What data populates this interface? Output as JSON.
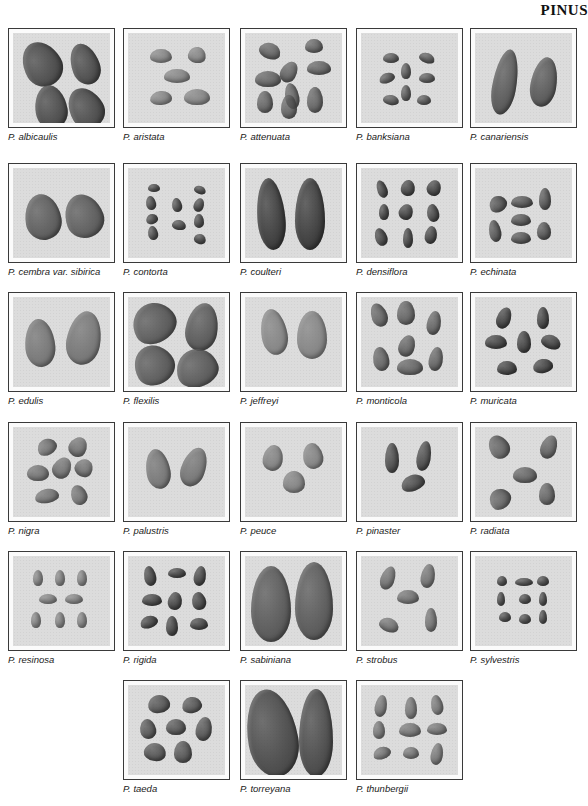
{
  "page": {
    "header": "PINUS"
  },
  "plates": [
    {
      "label": "P. albicaulis",
      "seed_color": "#3a3a3a",
      "seeds": [
        [
          10,
          8,
          38,
          46,
          -30
        ],
        [
          58,
          10,
          28,
          42,
          -20
        ],
        [
          22,
          52,
          32,
          44,
          -10
        ],
        [
          56,
          54,
          34,
          42,
          -30
        ]
      ]
    },
    {
      "label": "P. aristata",
      "seed_color": "#7a7a7a",
      "seeds": [
        [
          22,
          16,
          22,
          14,
          0
        ],
        [
          60,
          14,
          18,
          16,
          10
        ],
        [
          36,
          36,
          26,
          14,
          0
        ],
        [
          22,
          58,
          22,
          14,
          -5
        ],
        [
          56,
          56,
          26,
          16,
          0
        ]
      ]
    },
    {
      "label": "P. attenuata",
      "seed_color": "#555555",
      "seeds": [
        [
          14,
          10,
          22,
          16,
          20
        ],
        [
          60,
          6,
          18,
          14,
          0
        ],
        [
          36,
          28,
          16,
          22,
          30
        ],
        [
          62,
          28,
          24,
          14,
          0
        ],
        [
          10,
          38,
          26,
          16,
          0
        ],
        [
          40,
          50,
          14,
          26,
          -10
        ],
        [
          12,
          58,
          16,
          22,
          0
        ],
        [
          36,
          62,
          16,
          24,
          0
        ],
        [
          62,
          54,
          16,
          26,
          0
        ]
      ]
    },
    {
      "label": "P. banksiana",
      "seed_color": "#4a4a4a",
      "seeds": [
        [
          22,
          20,
          16,
          10,
          0
        ],
        [
          58,
          20,
          16,
          10,
          20
        ],
        [
          40,
          30,
          10,
          16,
          0
        ],
        [
          18,
          40,
          16,
          10,
          -20
        ],
        [
          58,
          40,
          16,
          10,
          0
        ],
        [
          40,
          52,
          10,
          16,
          0
        ],
        [
          22,
          62,
          16,
          10,
          10
        ],
        [
          56,
          62,
          14,
          10,
          0
        ]
      ]
    },
    {
      "label": "P. canariensis",
      "seed_color": "#4a4a4a",
      "seeds": [
        [
          18,
          16,
          24,
          66,
          10
        ],
        [
          56,
          24,
          26,
          50,
          10
        ]
      ]
    },
    {
      "label": "P. cembra var. sibirica",
      "seed_color": "#4d4d4d",
      "seeds": [
        [
          12,
          26,
          36,
          46,
          -10
        ],
        [
          52,
          26,
          38,
          44,
          -20
        ]
      ]
    },
    {
      "label": "P. contorta",
      "seed_color": "#3a3a3a",
      "seeds": [
        [
          20,
          16,
          12,
          8,
          0
        ],
        [
          66,
          18,
          12,
          8,
          20
        ],
        [
          18,
          28,
          10,
          14,
          -10
        ],
        [
          44,
          30,
          10,
          14,
          -10
        ],
        [
          66,
          30,
          10,
          14,
          20
        ],
        [
          18,
          46,
          12,
          10,
          -20
        ],
        [
          44,
          52,
          14,
          10,
          10
        ],
        [
          66,
          46,
          10,
          14,
          0
        ],
        [
          20,
          58,
          10,
          14,
          -10
        ],
        [
          66,
          66,
          12,
          10,
          20
        ]
      ]
    },
    {
      "label": "P. coulteri",
      "seed_color": "#2a2a2a",
      "seeds": [
        [
          12,
          10,
          28,
          72,
          -5
        ],
        [
          50,
          10,
          30,
          72,
          0
        ]
      ]
    },
    {
      "label": "P. densiflora",
      "seed_color": "#333333",
      "seeds": [
        [
          16,
          12,
          10,
          18,
          -20
        ],
        [
          40,
          12,
          14,
          16,
          10
        ],
        [
          66,
          12,
          14,
          16,
          20
        ],
        [
          18,
          36,
          10,
          16,
          0
        ],
        [
          38,
          36,
          14,
          16,
          20
        ],
        [
          66,
          36,
          12,
          18,
          -10
        ],
        [
          14,
          60,
          12,
          18,
          -20
        ],
        [
          42,
          60,
          10,
          20,
          0
        ],
        [
          64,
          58,
          12,
          18,
          10
        ]
      ]
    },
    {
      "label": "P. echinata",
      "seed_color": "#444444",
      "seeds": [
        [
          14,
          28,
          18,
          16,
          -30
        ],
        [
          36,
          28,
          22,
          12,
          0
        ],
        [
          64,
          20,
          12,
          22,
          0
        ],
        [
          36,
          46,
          20,
          12,
          0
        ],
        [
          14,
          52,
          12,
          22,
          -10
        ],
        [
          36,
          64,
          20,
          12,
          0
        ],
        [
          62,
          54,
          14,
          18,
          0
        ]
      ]
    },
    {
      "label": "P. edulis",
      "seed_color": "#6a6a6a",
      "seeds": [
        [
          12,
          22,
          30,
          48,
          -5
        ],
        [
          54,
          14,
          34,
          54,
          10
        ]
      ]
    },
    {
      "label": "P. flexilis",
      "seed_color": "#4a4a4a",
      "seeds": [
        [
          4,
          6,
          44,
          40,
          -30
        ],
        [
          58,
          6,
          32,
          48,
          10
        ],
        [
          6,
          48,
          40,
          40,
          -30
        ],
        [
          48,
          52,
          42,
          38,
          -20
        ]
      ]
    },
    {
      "label": "P. jeffreyi",
      "seed_color": "#7a7a7a",
      "seeds": [
        [
          16,
          12,
          26,
          46,
          -10
        ],
        [
          52,
          14,
          30,
          48,
          0
        ]
      ]
    },
    {
      "label": "P. monticola",
      "seed_color": "#555555",
      "seeds": [
        [
          10,
          6,
          16,
          24,
          -20
        ],
        [
          36,
          4,
          18,
          24,
          0
        ],
        [
          66,
          14,
          14,
          24,
          10
        ],
        [
          38,
          38,
          16,
          22,
          20
        ],
        [
          12,
          50,
          16,
          24,
          -10
        ],
        [
          36,
          62,
          26,
          16,
          0
        ],
        [
          68,
          50,
          14,
          24,
          10
        ]
      ]
    },
    {
      "label": "P. muricata",
      "seed_color": "#2f2f2f",
      "seeds": [
        [
          22,
          10,
          14,
          22,
          20
        ],
        [
          62,
          10,
          12,
          22,
          0
        ],
        [
          10,
          38,
          22,
          14,
          0
        ],
        [
          42,
          34,
          14,
          22,
          0
        ],
        [
          66,
          38,
          20,
          14,
          20
        ],
        [
          22,
          64,
          20,
          14,
          0
        ],
        [
          58,
          62,
          20,
          14,
          -10
        ]
      ]
    },
    {
      "label": "P. nigra",
      "seed_color": "#666666",
      "seeds": [
        [
          24,
          12,
          20,
          16,
          -30
        ],
        [
          56,
          10,
          18,
          20,
          30
        ],
        [
          14,
          38,
          22,
          16,
          0
        ],
        [
          40,
          30,
          18,
          22,
          30
        ],
        [
          62,
          32,
          18,
          18,
          30
        ],
        [
          22,
          62,
          24,
          14,
          -10
        ],
        [
          58,
          58,
          16,
          20,
          -20
        ]
      ]
    },
    {
      "label": "P. palustris",
      "seed_color": "#6a6a6a",
      "seeds": [
        [
          18,
          22,
          24,
          40,
          -10
        ],
        [
          54,
          20,
          24,
          40,
          20
        ]
      ]
    },
    {
      "label": "P. peuce",
      "seed_color": "#777777",
      "seeds": [
        [
          18,
          18,
          20,
          26,
          10
        ],
        [
          58,
          16,
          20,
          26,
          -10
        ],
        [
          38,
          44,
          22,
          22,
          0
        ]
      ]
    },
    {
      "label": "P. pinaster",
      "seed_color": "#3a3a3a",
      "seeds": [
        [
          24,
          16,
          14,
          30,
          0
        ],
        [
          56,
          14,
          14,
          30,
          10
        ],
        [
          40,
          48,
          24,
          16,
          -20
        ]
      ]
    },
    {
      "label": "P. radiata",
      "seed_color": "#555555",
      "seeds": [
        [
          14,
          8,
          20,
          24,
          -30
        ],
        [
          66,
          8,
          16,
          24,
          20
        ],
        [
          38,
          40,
          24,
          16,
          0
        ],
        [
          14,
          62,
          22,
          20,
          -40
        ],
        [
          64,
          56,
          16,
          22,
          0
        ]
      ]
    },
    {
      "label": "P. resinosa",
      "seed_color": "#7a7a7a",
      "seeds": [
        [
          20,
          14,
          10,
          16,
          0
        ],
        [
          42,
          14,
          10,
          16,
          0
        ],
        [
          64,
          14,
          10,
          16,
          0
        ],
        [
          26,
          38,
          18,
          10,
          0
        ],
        [
          52,
          38,
          18,
          10,
          0
        ],
        [
          18,
          56,
          10,
          16,
          0
        ],
        [
          42,
          56,
          10,
          16,
          0
        ],
        [
          64,
          56,
          10,
          16,
          0
        ]
      ]
    },
    {
      "label": "P. rigida",
      "seed_color": "#333333",
      "seeds": [
        [
          16,
          10,
          12,
          20,
          -10
        ],
        [
          40,
          12,
          18,
          10,
          0
        ],
        [
          66,
          10,
          12,
          20,
          10
        ],
        [
          14,
          38,
          20,
          12,
          0
        ],
        [
          40,
          36,
          14,
          18,
          10
        ],
        [
          64,
          36,
          14,
          18,
          -10
        ],
        [
          12,
          60,
          18,
          12,
          -20
        ],
        [
          38,
          60,
          12,
          20,
          0
        ],
        [
          62,
          62,
          18,
          12,
          0
        ]
      ]
    },
    {
      "label": "P. sabiniana",
      "seed_color": "#4a4a4a",
      "seeds": [
        [
          6,
          10,
          40,
          76,
          0
        ],
        [
          50,
          6,
          38,
          78,
          0
        ]
      ]
    },
    {
      "label": "P. strobus",
      "seed_color": "#666666",
      "seeds": [
        [
          20,
          10,
          14,
          24,
          20
        ],
        [
          60,
          8,
          14,
          24,
          10
        ],
        [
          36,
          34,
          22,
          14,
          0
        ],
        [
          18,
          62,
          20,
          14,
          20
        ],
        [
          64,
          52,
          12,
          24,
          0
        ]
      ]
    },
    {
      "label": "P. sylvestris",
      "seed_color": "#3a3a3a",
      "seeds": [
        [
          22,
          20,
          10,
          10,
          0
        ],
        [
          40,
          22,
          18,
          8,
          0
        ],
        [
          62,
          20,
          12,
          10,
          0
        ],
        [
          22,
          36,
          8,
          14,
          0
        ],
        [
          44,
          38,
          12,
          10,
          0
        ],
        [
          64,
          36,
          8,
          14,
          0
        ],
        [
          24,
          56,
          12,
          10,
          0
        ],
        [
          44,
          58,
          12,
          10,
          0
        ],
        [
          64,
          54,
          8,
          14,
          0
        ]
      ]
    },
    {
      "label": "P. taeda",
      "seed_color": "#444444",
      "seeds": [
        [
          20,
          10,
          22,
          18,
          -10
        ],
        [
          54,
          12,
          20,
          16,
          -10
        ],
        [
          12,
          34,
          16,
          20,
          -10
        ],
        [
          38,
          34,
          20,
          16,
          0
        ],
        [
          68,
          32,
          16,
          24,
          10
        ],
        [
          16,
          58,
          22,
          18,
          10
        ],
        [
          46,
          56,
          18,
          22,
          0
        ]
      ]
    },
    {
      "label": "P. torreyana",
      "seed_color": "#3a3a3a",
      "seeds": [
        [
          2,
          4,
          50,
          88,
          -10
        ],
        [
          54,
          4,
          34,
          88,
          0
        ]
      ]
    },
    {
      "label": "P. thunbergii",
      "seed_color": "#6a6a6a",
      "seeds": [
        [
          14,
          10,
          12,
          22,
          10
        ],
        [
          44,
          12,
          12,
          22,
          0
        ],
        [
          70,
          10,
          12,
          20,
          -10
        ],
        [
          12,
          36,
          12,
          18,
          0
        ],
        [
          38,
          38,
          22,
          14,
          0
        ],
        [
          66,
          38,
          20,
          12,
          0
        ],
        [
          12,
          62,
          18,
          12,
          -20
        ],
        [
          42,
          62,
          16,
          12,
          0
        ],
        [
          70,
          58,
          12,
          22,
          10
        ]
      ]
    }
  ]
}
